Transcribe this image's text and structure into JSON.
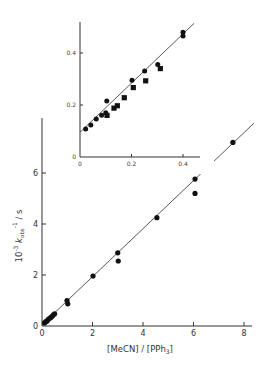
{
  "chart_data": [
    {
      "name": "main",
      "type": "scatter",
      "title": "",
      "xlabel": "[MeCN] / [PPh3]",
      "xlabel_parts": {
        "pre": "[MeCN] / [PPh",
        "sub": "3",
        "post": "]"
      },
      "ylabel": "10^-3 k_obs^-1 / s",
      "ylabel_parts": {
        "a": "10",
        "a_sup": "-3",
        "b": "k",
        "b_sub": "obs",
        "b_sup": "-1",
        "c": " / s"
      },
      "xlim": [
        0,
        8.5
      ],
      "ylim": [
        0,
        8
      ],
      "xticks": [
        0,
        2,
        4,
        6,
        8
      ],
      "yticks": [
        0,
        2,
        4,
        6
      ],
      "grid": false,
      "legend": null,
      "fit_line": {
        "x": [
          0,
          8.4
        ],
        "y": [
          0.05,
          7.96
        ]
      },
      "series": [
        {
          "name": "circles",
          "marker": "circle",
          "points": [
            [
              0.1,
              0.12
            ],
            [
              0.15,
              0.17
            ],
            [
              0.2,
              0.2
            ],
            [
              0.25,
              0.26
            ],
            [
              0.3,
              0.3
            ],
            [
              0.35,
              0.33
            ],
            [
              0.4,
              0.38
            ],
            [
              0.45,
              0.44
            ],
            [
              0.5,
              0.48
            ],
            [
              0.99,
              1.0
            ],
            [
              1.02,
              0.87
            ],
            [
              2.02,
              1.96
            ],
            [
              3.0,
              2.87
            ],
            [
              3.02,
              2.55
            ],
            [
              4.55,
              4.25
            ],
            [
              6.06,
              5.76
            ],
            [
              6.06,
              5.2
            ],
            [
              7.56,
              7.2
            ]
          ]
        }
      ]
    },
    {
      "name": "inset",
      "type": "scatter",
      "title": "",
      "xlabel": "",
      "ylabel": "",
      "xlim": [
        0,
        0.46
      ],
      "ylim": [
        0,
        0.52
      ],
      "xticks": [
        0,
        0.2,
        0.4
      ],
      "xtick_labels": [
        "0",
        "0.2",
        "0.4"
      ],
      "yticks": [
        0,
        0.2,
        0.4
      ],
      "ytick_labels": [
        "0",
        "0.2",
        "0.4"
      ],
      "grid": false,
      "fit_line": {
        "x": [
          0,
          0.443
        ],
        "y": [
          0.095,
          0.514
        ]
      },
      "series": [
        {
          "name": "circles",
          "marker": "circle",
          "points": [
            [
              0.022,
              0.108
            ],
            [
              0.042,
              0.123
            ],
            [
              0.063,
              0.146
            ],
            [
              0.084,
              0.161
            ],
            [
              0.1,
              0.17
            ],
            [
              0.104,
              0.215
            ],
            [
              0.202,
              0.295
            ],
            [
              0.251,
              0.331
            ],
            [
              0.302,
              0.356
            ],
            [
              0.4,
              0.48
            ],
            [
              0.4,
              0.465
            ]
          ]
        },
        {
          "name": "squares",
          "marker": "square",
          "points": [
            [
              0.105,
              0.16
            ],
            [
              0.132,
              0.188
            ],
            [
              0.145,
              0.197
            ],
            [
              0.172,
              0.228
            ],
            [
              0.207,
              0.267
            ],
            [
              0.255,
              0.293
            ],
            [
              0.312,
              0.34
            ]
          ]
        }
      ]
    }
  ]
}
